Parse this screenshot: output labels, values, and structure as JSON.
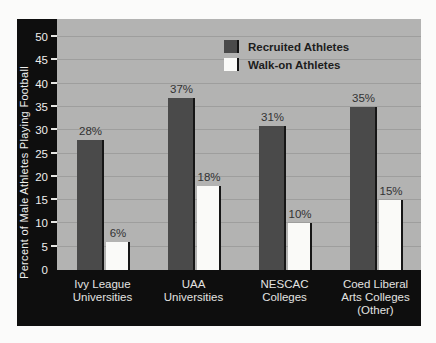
{
  "chart_data": {
    "type": "bar",
    "categories": [
      "Ivy League Universities",
      "UAA Universities",
      "NESCAC Colleges",
      "Coed Liberal Arts Colleges (Other)"
    ],
    "category_label_lines": [
      [
        "Ivy League",
        "Universities"
      ],
      [
        "UAA",
        "Universities"
      ],
      [
        "NESCAC",
        "Colleges"
      ],
      [
        "Coed Liberal",
        "Arts Colleges",
        "(Other)"
      ]
    ],
    "series": [
      {
        "name": "Recruited Athletes",
        "values": [
          28,
          37,
          31,
          35
        ],
        "value_labels": [
          "28%",
          "37%",
          "31%",
          "35%"
        ],
        "color": "#4a4a4a"
      },
      {
        "name": "Walk-on Athletes",
        "values": [
          6,
          18,
          10,
          15
        ],
        "value_labels": [
          "6%",
          "18%",
          "10%",
          "15%"
        ],
        "color": "#fafaf8"
      }
    ],
    "title": "",
    "xlabel": "",
    "ylabel": "Percent of Male Athletes Playing Football",
    "ylim": [
      0,
      50
    ],
    "ytick_step": 5,
    "ytick_labels": [
      "0",
      "5",
      "10",
      "15",
      "20",
      "25",
      "30",
      "35",
      "40",
      "45",
      "50"
    ],
    "grid": true,
    "legend_position": "top-right"
  },
  "colors": {
    "page_background": "#fbfbfa",
    "frame_black": "#0e0e0e",
    "plot_background": "#b3b3b2",
    "gridline": "#9e9e9d",
    "bar_recruited": "#4a4a4a",
    "bar_walkon": "#fafaf8",
    "bar_shadow": "#161616",
    "axis_text": "#efefed",
    "value_text": "#323232",
    "legend_text": "#1d1d1d"
  },
  "artifacts": {
    "nescac_dot": "·"
  }
}
